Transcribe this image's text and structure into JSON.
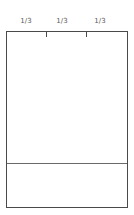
{
  "diagram": {
    "labels": [
      {
        "text": "1/3",
        "x": 16
      },
      {
        "text": "1/3",
        "x": 52
      },
      {
        "text": "1/3",
        "x": 90
      }
    ],
    "ticks": [
      40,
      80
    ],
    "divider_top": 131,
    "colors": {
      "border": "#4a4a4a",
      "divider": "#6a6a6a",
      "label": "#5a5a5a",
      "background": "#ffffff"
    }
  }
}
